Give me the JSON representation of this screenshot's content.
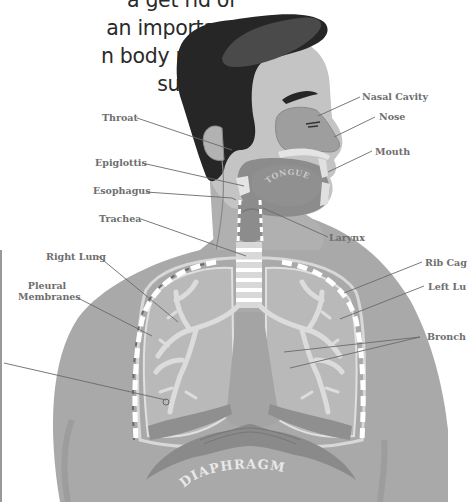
{
  "intro_text": {
    "lines": [
      "a get rid of",
      "an important",
      "n body needs",
      "survive."
    ]
  },
  "diagram": {
    "organ_labels": {
      "tongue": "TONGUE",
      "diaphragm": "DIAPHRAGM"
    },
    "labels": [
      {
        "id": "nasal-cavity",
        "text": "Nasal Cavity"
      },
      {
        "id": "nose",
        "text": "Nose"
      },
      {
        "id": "throat",
        "text": "Throat"
      },
      {
        "id": "mouth",
        "text": "Mouth"
      },
      {
        "id": "epiglottis",
        "text": "Epiglottis"
      },
      {
        "id": "esophagus",
        "text": "Esophagus"
      },
      {
        "id": "larynx",
        "text": "Larynx"
      },
      {
        "id": "trachea",
        "text": "Trachea"
      },
      {
        "id": "right-lung",
        "text": "Right Lung"
      },
      {
        "id": "rib-cage",
        "text": "Rib Cag"
      },
      {
        "id": "pleural-line1",
        "text": "Pleural"
      },
      {
        "id": "pleural-line2",
        "text": "Membranes"
      },
      {
        "id": "left-lung",
        "text": "Left Lu"
      },
      {
        "id": "bronchi",
        "text": "Bronch"
      }
    ]
  },
  "colors": {
    "body": "#a9a9a9",
    "skin_face": "#c4c4c4",
    "hair": "#262626",
    "hair_highlight": "#4a4a4a",
    "lung_fill": "#b9b9b9",
    "bronchi": "#dcdcdc",
    "cavity": "#8c8c8c",
    "label_text": "#6e6e6e",
    "leader_line": "#6a6a6a"
  }
}
